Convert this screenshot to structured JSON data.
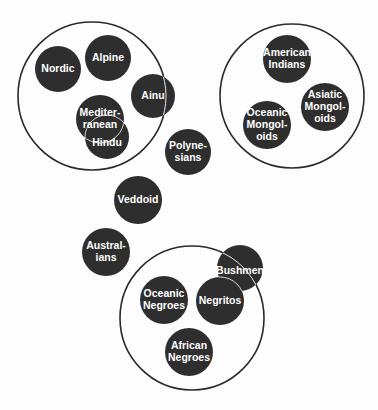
{
  "diagram": {
    "type": "grouped-circle-diagram",
    "colors": {
      "background": "#fdfdfd",
      "group_outline": "#2a2a2a",
      "node_fill": "#2e2e2e",
      "node_text": "#ffffff",
      "overlap_outline": "#e8e8e8"
    },
    "groups": [
      {
        "id": "group-1",
        "cx": 92,
        "cy": 96,
        "r": 74,
        "members": [
          "Nordic",
          "Alpine",
          "Mediterranean",
          "Hindu"
        ],
        "partial_members": [
          "Ainu"
        ]
      },
      {
        "id": "group-2",
        "cx": 292,
        "cy": 96,
        "r": 72,
        "members": [
          "American Indians",
          "Asiatic Mongoloids",
          "Oceanic Mongoloids"
        ]
      },
      {
        "id": "group-3",
        "cx": 192,
        "cy": 318,
        "r": 72,
        "members": [
          "Oceanic Negroes",
          "Negritos",
          "African Negroes"
        ],
        "partial_members": [
          "Bushmen"
        ]
      }
    ],
    "nodes": [
      {
        "id": "nordic",
        "cx": 58,
        "cy": 69,
        "r": 23,
        "lines": [
          "Nordic"
        ]
      },
      {
        "id": "alpine",
        "cx": 108,
        "cy": 58,
        "r": 23,
        "lines": [
          "Alpine"
        ]
      },
      {
        "id": "ainu",
        "cx": 153,
        "cy": 96,
        "r": 22,
        "lines": [
          "Ainu"
        ]
      },
      {
        "id": "mediterranean",
        "cx": 100,
        "cy": 119,
        "r": 24,
        "lines": [
          "Mediter-",
          "ranean"
        ]
      },
      {
        "id": "hindu",
        "cx": 107,
        "cy": 137,
        "r": 22,
        "lines": [
          "Hindu"
        ],
        "label_dy": 6
      },
      {
        "id": "american-indians",
        "cx": 287,
        "cy": 59,
        "r": 24,
        "lines": [
          "American",
          "Indians"
        ]
      },
      {
        "id": "asiatic-mongoloids",
        "cx": 325,
        "cy": 107,
        "r": 24,
        "lines": [
          "Asiatic",
          "Mongol-",
          "oids"
        ]
      },
      {
        "id": "oceanic-mongoloids",
        "cx": 267,
        "cy": 125,
        "r": 24,
        "lines": [
          "Oceanic",
          "Mongol-",
          "oids"
        ]
      },
      {
        "id": "polynesians",
        "cx": 188,
        "cy": 152,
        "r": 23,
        "lines": [
          "Polyne-",
          "sians"
        ]
      },
      {
        "id": "veddoid",
        "cx": 138,
        "cy": 200,
        "r": 24,
        "lines": [
          "Veddoid"
        ]
      },
      {
        "id": "australians",
        "cx": 106,
        "cy": 252,
        "r": 24,
        "lines": [
          "Austral-",
          "ians"
        ]
      },
      {
        "id": "bushmen",
        "cx": 240,
        "cy": 268,
        "r": 23,
        "lines": [
          "Bushmen"
        ],
        "label_dy": 3
      },
      {
        "id": "negritos",
        "cx": 220,
        "cy": 301,
        "r": 24,
        "lines": [
          "Negritos"
        ]
      },
      {
        "id": "oceanic-negroes",
        "cx": 164,
        "cy": 300,
        "r": 24,
        "lines": [
          "Oceanic",
          "Negroes"
        ]
      },
      {
        "id": "african-negroes",
        "cx": 189,
        "cy": 352,
        "r": 24,
        "lines": [
          "African",
          "Negroes"
        ]
      }
    ],
    "overlap_outlines": [
      {
        "over": "mediterranean",
        "of": "hindu"
      },
      {
        "over": "hindu",
        "of": "mediterranean"
      },
      {
        "over": "bushmen",
        "of": "negritos"
      }
    ],
    "group_lines_over_nodes": [
      {
        "group": "group-1",
        "node": "ainu"
      },
      {
        "group": "group-3",
        "node": "bushmen"
      }
    ]
  }
}
